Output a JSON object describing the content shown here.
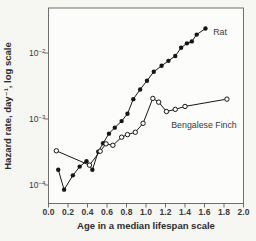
{
  "figure": {
    "background": "#f6f6f3",
    "plot_background": "#fcfcfa",
    "frame_color": "#6e6e6e",
    "data_color": "#161616",
    "text_color": "#2d2d2d"
  },
  "chart_data": {
    "type": "line",
    "title": "",
    "xlabel": "Age in a median lifespan scale",
    "ylabel": "Hazard rate, day⁻¹, log scale",
    "x_scale": "linear",
    "y_scale": "log",
    "xlim": [
      0.0,
      2.0
    ],
    "ylim": [
      5.2e-05,
      0.048
    ],
    "grid": false,
    "x_ticks": [
      "0.0",
      "0.2",
      "0.4",
      "0.6",
      "0.8",
      "1.0",
      "1.2",
      "1.4",
      "1.6",
      "1.8",
      "2.0"
    ],
    "y_ticks": [
      {
        "value": 0.01,
        "base": "10",
        "exp": "−2"
      },
      {
        "value": 0.001,
        "base": "10",
        "exp": "−3"
      },
      {
        "value": 0.0001,
        "base": "10",
        "exp": "−4"
      }
    ],
    "series": [
      {
        "name": "Rat",
        "marker": "filled-circle",
        "color": "#161616",
        "points": [
          [
            0.1,
            0.00017
          ],
          [
            0.16,
            8.5e-05
          ],
          [
            0.25,
            0.00014
          ],
          [
            0.32,
            0.00019
          ],
          [
            0.39,
            0.00023
          ],
          [
            0.45,
            0.00017
          ],
          [
            0.51,
            0.00032
          ],
          [
            0.56,
            0.00043
          ],
          [
            0.62,
            0.0006
          ],
          [
            0.68,
            0.00074
          ],
          [
            0.75,
            0.00093
          ],
          [
            0.81,
            0.0012
          ],
          [
            0.87,
            0.002
          ],
          [
            0.94,
            0.0028
          ],
          [
            1.01,
            0.0038
          ],
          [
            1.08,
            0.0052
          ],
          [
            1.16,
            0.0064
          ],
          [
            1.23,
            0.0076
          ],
          [
            1.3,
            0.009
          ],
          [
            1.36,
            0.012
          ],
          [
            1.42,
            0.014
          ],
          [
            1.47,
            0.015
          ],
          [
            1.52,
            0.019
          ],
          [
            1.61,
            0.0235
          ]
        ]
      },
      {
        "name": "Bengalese Finch",
        "marker": "open-circle",
        "color": "#161616",
        "points": [
          [
            0.08,
            0.00033
          ],
          [
            0.42,
            0.0002
          ],
          [
            0.53,
            0.000325
          ],
          [
            0.59,
            0.00042
          ],
          [
            0.66,
            0.0004
          ],
          [
            0.75,
            0.00053
          ],
          [
            0.81,
            0.00058
          ],
          [
            0.89,
            0.00063
          ],
          [
            0.97,
            0.00086
          ],
          [
            1.07,
            0.00205
          ],
          [
            1.13,
            0.0018
          ],
          [
            1.21,
            0.0013
          ],
          [
            1.3,
            0.0014
          ],
          [
            1.4,
            0.00155
          ],
          [
            1.83,
            0.002
          ]
        ]
      }
    ],
    "annotations": [
      {
        "text": "Rat",
        "x": 1.69,
        "y": 0.0208,
        "anchor": "start"
      },
      {
        "text": "Bengalese Finch",
        "x": 1.595,
        "y": 0.0008,
        "anchor": "middle"
      }
    ]
  }
}
